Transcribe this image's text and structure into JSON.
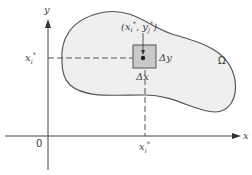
{
  "diagram": {
    "type": "region-partition-illustration",
    "axes": {
      "x_label": "x",
      "y_label": "y",
      "origin_label": "0"
    },
    "region": {
      "label": "Ω",
      "fill": "#efefef",
      "stroke": "#555555"
    },
    "sample_point": {
      "label_open": "(x",
      "label_sub_i": "i",
      "label_star1": "*",
      "label_sep": ", y",
      "label_sub_j": "j",
      "label_star2": "*",
      "label_close": ")"
    },
    "cell": {
      "fill": "#c9c9c9",
      "stroke": "#555555",
      "delta_x_label": "Δx",
      "delta_y_label": "Δy"
    },
    "y_axis_marker": {
      "base": "x",
      "sub": "i",
      "star": "*"
    },
    "x_axis_marker": {
      "base": "x",
      "sub": "i",
      "star": "*"
    }
  }
}
